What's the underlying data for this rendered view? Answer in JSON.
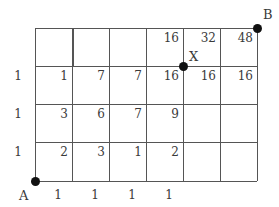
{
  "diagram": {
    "type": "grid-path-counting",
    "columns": 6,
    "rows": 4,
    "grid": {
      "x_lines": [
        35,
        72,
        109,
        146,
        183,
        220,
        257
      ],
      "y_lines": [
        28,
        66,
        104,
        142,
        181
      ],
      "line_color": "#555555"
    },
    "points": [
      {
        "name": "A",
        "label": "A",
        "x": 35,
        "y": 181,
        "label_dx": -16,
        "label_dy": 8
      },
      {
        "name": "X",
        "label": "X",
        "x": 183,
        "y": 66,
        "label_dx": 6,
        "label_dy": -16
      },
      {
        "name": "B",
        "label": "B",
        "x": 257,
        "y": 28,
        "label_dx": 6,
        "label_dy": -20
      }
    ],
    "row_labels": [
      {
        "text": "1",
        "y": 66
      },
      {
        "text": "1",
        "y": 104
      },
      {
        "text": "1",
        "y": 142
      }
    ],
    "bottom_labels": [
      {
        "text": "1",
        "x": 72
      },
      {
        "text": "1",
        "x": 109
      },
      {
        "text": "1",
        "x": 146
      },
      {
        "text": "1",
        "x": 183
      }
    ],
    "node_values": [
      {
        "text": "16",
        "x": 183,
        "y": 28
      },
      {
        "text": "32",
        "x": 220,
        "y": 28
      },
      {
        "text": "48",
        "x": 257,
        "y": 28
      },
      {
        "text": "1",
        "x": 72,
        "y": 66
      },
      {
        "text": "7",
        "x": 109,
        "y": 66
      },
      {
        "text": "7",
        "x": 146,
        "y": 66
      },
      {
        "text": "16",
        "x": 183,
        "y": 66
      },
      {
        "text": "16",
        "x": 220,
        "y": 66
      },
      {
        "text": "16",
        "x": 257,
        "y": 66
      },
      {
        "text": "3",
        "x": 72,
        "y": 104
      },
      {
        "text": "6",
        "x": 109,
        "y": 104
      },
      {
        "text": "7",
        "x": 146,
        "y": 104
      },
      {
        "text": "9",
        "x": 183,
        "y": 104
      },
      {
        "text": "2",
        "x": 72,
        "y": 142
      },
      {
        "text": "3",
        "x": 109,
        "y": 142
      },
      {
        "text": "1",
        "x": 146,
        "y": 142
      },
      {
        "text": "2",
        "x": 183,
        "y": 142
      }
    ],
    "missing_segments": [
      {
        "orientation": "vertical",
        "x": 72,
        "y1": 28,
        "y2": 66,
        "note": "thick double line appearance"
      }
    ]
  }
}
